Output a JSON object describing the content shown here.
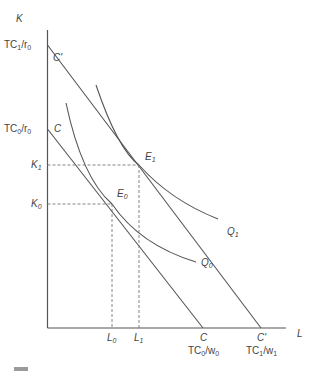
{
  "figure": {
    "type": "isocost-isoquant diagram",
    "axes": {
      "y_label": "K",
      "x_label": "L"
    },
    "y_ticks": [
      {
        "main": "TC",
        "sub": "1",
        "tail": "/r",
        "tail_sub": "0"
      },
      {
        "main": "TC",
        "sub": "0",
        "tail": "/r",
        "tail_sub": "0"
      },
      {
        "main": "K",
        "sub": "1"
      },
      {
        "main": "K",
        "sub": "0"
      }
    ],
    "x_ticks": [
      {
        "main": "L",
        "sub": "0"
      },
      {
        "main": "L",
        "sub": "1"
      }
    ],
    "x_intercepts": [
      {
        "line": "C",
        "main": "TC",
        "sub": "0",
        "tail": "/w",
        "tail_sub": "0"
      },
      {
        "line": "C'",
        "main": "TC",
        "sub": "1",
        "tail": "/w",
        "tail_sub": "1"
      }
    ],
    "isocost_lines": [
      {
        "name": "C",
        "label": "C"
      },
      {
        "name": "C'",
        "label": "C'"
      }
    ],
    "isoquants": [
      {
        "name": "Q0",
        "main": "Q",
        "sub": "0"
      },
      {
        "name": "Q1",
        "main": "Q",
        "sub": "1"
      }
    ],
    "equilibria": [
      {
        "name": "E0",
        "main": "E",
        "sub": "0"
      },
      {
        "name": "E1",
        "main": "E",
        "sub": "1"
      }
    ],
    "colors": {
      "line": "#555555",
      "dashed": "#777777",
      "text": "#444444"
    }
  }
}
